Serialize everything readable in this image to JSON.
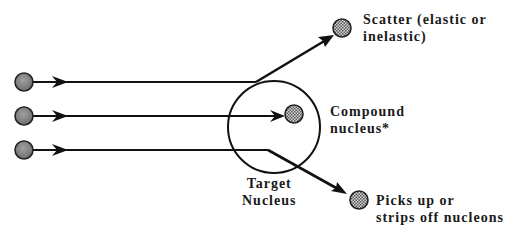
{
  "diagram": {
    "labels": {
      "scatter_line1": "Scatter (elastic or",
      "scatter_line2": "inelastic)",
      "compound_line1": "Compound",
      "compound_line2": "nucleus*",
      "target_line1": "Target",
      "target_line2": "Nucleus",
      "pickup_line1": "Picks up or",
      "pickup_line2": "strips off nucleons"
    },
    "colors": {
      "line": "#111111",
      "projectile_fill": "#8a8a8a",
      "product_fill": "#9a9a9a",
      "background": "#ffffff"
    },
    "projectiles": [
      {
        "x": 24,
        "y": 82
      },
      {
        "x": 24,
        "y": 116
      },
      {
        "x": 24,
        "y": 150
      }
    ],
    "target_nucleus": {
      "cx": 274,
      "cy": 127,
      "r": 46
    },
    "products": [
      {
        "name": "scatter",
        "x": 342,
        "y": 28
      },
      {
        "name": "compound",
        "x": 294,
        "y": 114
      },
      {
        "name": "pickup",
        "x": 359,
        "y": 200
      }
    ]
  }
}
